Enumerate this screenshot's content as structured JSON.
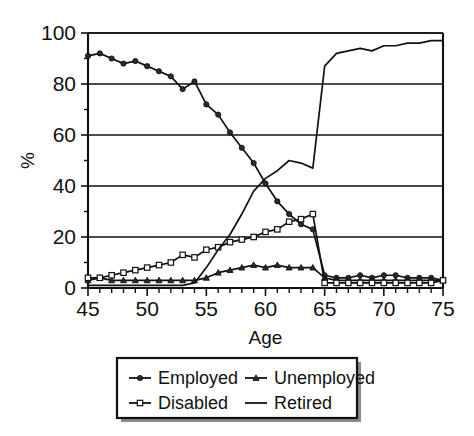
{
  "chart_data": {
    "type": "line",
    "title": "",
    "subtitle": "",
    "xlabel": "Age",
    "ylabel": "%",
    "xlim": [
      45,
      75
    ],
    "ylim": [
      0,
      100
    ],
    "x_ticks": [
      45,
      50,
      55,
      60,
      65,
      70,
      75
    ],
    "x_tick_labels": [
      "45",
      "50",
      "55",
      "60",
      "65",
      "70",
      "75"
    ],
    "x_minor_tick_step": 1,
    "y_ticks": [
      0,
      20,
      40,
      60,
      80,
      100
    ],
    "y_tick_labels": [
      "0",
      "20",
      "40",
      "60",
      "80",
      "100"
    ],
    "y_minor_tick_step": 10,
    "grid": "horizontal",
    "legend_position": "below-center",
    "legend_columns": 2,
    "x": [
      45,
      46,
      47,
      48,
      49,
      50,
      51,
      52,
      53,
      54,
      55,
      56,
      57,
      58,
      59,
      60,
      61,
      62,
      63,
      64,
      65,
      66,
      67,
      68,
      69,
      70,
      71,
      72,
      73,
      74,
      75
    ],
    "series": [
      {
        "name": "Employed",
        "marker": "filled-circle",
        "values": [
          91,
          92,
          90,
          88,
          89,
          87,
          85,
          83,
          78,
          81,
          72,
          68,
          61,
          55,
          49,
          41,
          34,
          29,
          25,
          23,
          5,
          4,
          4,
          5,
          4,
          5,
          5,
          4,
          4,
          4,
          3
        ]
      },
      {
        "name": "Unemployed",
        "marker": "filled-triangle",
        "values": [
          3,
          4,
          3,
          3,
          3,
          3,
          3,
          3,
          3,
          3,
          4,
          6,
          7,
          8,
          9,
          8,
          9,
          8,
          8,
          8,
          4,
          3,
          3,
          3,
          3,
          3,
          3,
          3,
          3,
          3,
          3
        ]
      },
      {
        "name": "Disabled",
        "marker": "open-square",
        "values": [
          4,
          4,
          5,
          6,
          7,
          8,
          9,
          10,
          13,
          12,
          15,
          16,
          18,
          19,
          20,
          22,
          23,
          26,
          27,
          29,
          2,
          2,
          2,
          2,
          2,
          2,
          2,
          2,
          2,
          2,
          3
        ]
      },
      {
        "name": "Retired",
        "marker": "none",
        "values": [
          1,
          1,
          1,
          1,
          1,
          1,
          1,
          1,
          1,
          2,
          8,
          15,
          21,
          29,
          38,
          43,
          46,
          50,
          49,
          47,
          87,
          92,
          93,
          94,
          93,
          95,
          95,
          96,
          96,
          97,
          97
        ]
      }
    ],
    "legend": [
      {
        "label": "Employed",
        "marker": "filled-circle"
      },
      {
        "label": "Unemployed",
        "marker": "filled-triangle"
      },
      {
        "label": "Disabled",
        "marker": "open-square"
      },
      {
        "label": "Retired",
        "marker": "none"
      }
    ],
    "colors": {
      "line": "#111111",
      "background": "#ffffff",
      "grid": "#111111"
    }
  }
}
